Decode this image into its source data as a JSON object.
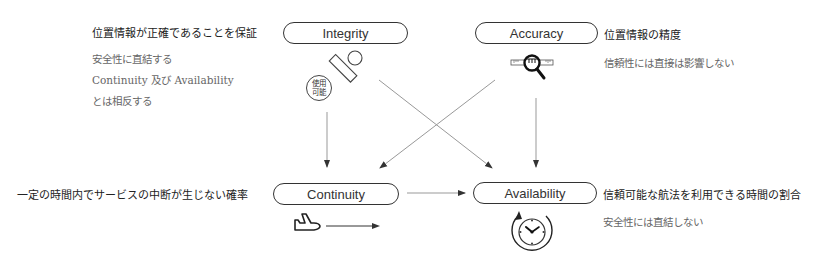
{
  "diagram": {
    "nodes": {
      "integrity": {
        "label": "Integrity",
        "description": "位置情報が正確であることを保証",
        "notes": [
          "安全性に直結する",
          "Continuity 及び Availability",
          "とは相反する"
        ],
        "icon": "stamp-icon",
        "badge": [
          "使用",
          "可能"
        ]
      },
      "accuracy": {
        "label": "Accuracy",
        "description": "位置情報の精度",
        "notes": [
          "信頼性には直接は影響しない"
        ],
        "icon": "magnifier-ruler-icon"
      },
      "continuity": {
        "label": "Continuity",
        "description": "一定の時間内でサービスの中断が生じない確率",
        "icon": "airplane-icon"
      },
      "availability": {
        "label": "Availability",
        "description": "信頼可能な航法を利用できる時間の割合",
        "notes": [
          "安全性には直結しない"
        ],
        "icon": "clock-cycle-icon"
      }
    },
    "edges": [
      {
        "from": "Integrity",
        "to": "Continuity"
      },
      {
        "from": "Integrity",
        "to": "Availability"
      },
      {
        "from": "Accuracy",
        "to": "Continuity"
      },
      {
        "from": "Accuracy",
        "to": "Availability"
      },
      {
        "from": "Continuity",
        "to": "Availability"
      }
    ],
    "colors": {
      "line": "#999999",
      "stroke": "#333333",
      "text": "#222222",
      "note": "#666666"
    }
  }
}
